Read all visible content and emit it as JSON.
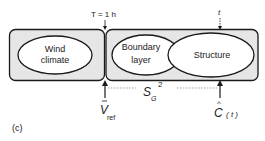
{
  "figure": {
    "panel_label": "(c)",
    "top_labels": {
      "T_label": "T = 1 h",
      "t_label": "t"
    },
    "boxes": [
      {
        "name": "wind-climate-box",
        "ellipses": [
          {
            "lines": [
              "Wind",
              "climate"
            ]
          }
        ]
      },
      {
        "name": "response-box",
        "ellipses": [
          {
            "lines": [
              "Boundary",
              "layer"
            ]
          },
          {
            "lines": [
              "Structure"
            ]
          }
        ]
      }
    ],
    "wind_climate": {
      "line1": "Wind",
      "line2": "climate"
    },
    "boundary_layer": {
      "line1": "Boundary",
      "line2": "layer"
    },
    "structure": {
      "label": "Structure"
    },
    "bottom": {
      "v_main": "V",
      "v_sub": "ref",
      "s_main": "S",
      "s_sub": "G",
      "s_sup": "2",
      "c_main": "C",
      "c_hat": "^",
      "c_arg": "( t )"
    },
    "colors": {
      "box_fill": "#e6e6e6",
      "ellipse_fill": "#ffffff",
      "stroke": "#1a1a1a"
    }
  }
}
